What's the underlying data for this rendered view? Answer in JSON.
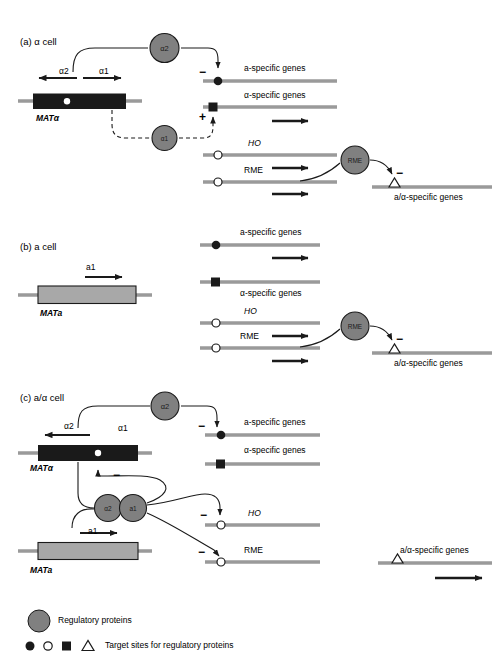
{
  "figure": {
    "type": "diagram",
    "colors": {
      "dna_line": "#9a9a9a",
      "protein_fill": "#808080",
      "mat_alpha_box": "#1a1a1a",
      "mat_a_box": "#a8a8a8",
      "stroke": "#1a1a1a"
    }
  },
  "panels": [
    {
      "id": "a",
      "title": "(a) α cell",
      "locus": {
        "name": "MATα",
        "style": "dark",
        "transcripts": [
          {
            "label": "α2",
            "direction": "left"
          },
          {
            "label": "α1",
            "direction": "right"
          }
        ]
      },
      "proteins": [
        {
          "label": "α2"
        },
        {
          "label": "α1"
        }
      ],
      "targets": [
        {
          "label": "a-specific genes",
          "italic": false,
          "site": "filled-circle",
          "sign": "−",
          "expressed": false
        },
        {
          "label": "α-specific genes",
          "italic": false,
          "site": "filled-square",
          "sign": "+",
          "expressed": true
        },
        {
          "label": "HO",
          "italic": true,
          "site": "open-circle",
          "sign": "",
          "expressed": true
        },
        {
          "label": "RME",
          "italic": false,
          "site": "open-circle",
          "sign": "",
          "expressed": true
        },
        {
          "label": "a/α-specific genes",
          "italic": false,
          "site": "open-triangle",
          "sign": "−",
          "expressed": false
        }
      ],
      "rme_protein": {
        "label": "RME"
      }
    },
    {
      "id": "b",
      "title": "(b) a cell",
      "locus": {
        "name": "MATa",
        "style": "light",
        "transcripts": [
          {
            "label": "a1",
            "direction": "right"
          }
        ]
      },
      "proteins": [],
      "targets": [
        {
          "label": "a-specific genes",
          "italic": false,
          "site": "filled-circle",
          "sign": "",
          "expressed": true
        },
        {
          "label": "α-specific genes",
          "italic": false,
          "site": "filled-square",
          "sign": "",
          "expressed": false
        },
        {
          "label": "HO",
          "italic": true,
          "site": "open-circle",
          "sign": "",
          "expressed": true
        },
        {
          "label": "RME",
          "italic": false,
          "site": "open-circle",
          "sign": "",
          "expressed": true
        },
        {
          "label": "a/α-specific genes",
          "italic": false,
          "site": "open-triangle",
          "sign": "−",
          "expressed": false
        }
      ],
      "rme_protein": {
        "label": "RME"
      }
    },
    {
      "id": "c",
      "title": "(c) a/α cell",
      "loci": [
        {
          "name": "MATα",
          "style": "dark",
          "transcripts": [
            {
              "label": "α2",
              "direction": "left"
            },
            {
              "label": "α1",
              "direction": "none"
            }
          ]
        },
        {
          "name": "MATa",
          "style": "light",
          "transcripts": [
            {
              "label": "a1",
              "direction": "right"
            }
          ]
        }
      ],
      "proteins": [
        {
          "label": "α2"
        },
        {
          "label": "α2"
        },
        {
          "label": "a1"
        }
      ],
      "targets": [
        {
          "label": "a-specific genes",
          "italic": false,
          "site": "filled-circle",
          "sign": "−",
          "expressed": false
        },
        {
          "label": "α-specific genes",
          "italic": false,
          "site": "filled-square",
          "sign": "",
          "expressed": false
        },
        {
          "label": "HO",
          "italic": true,
          "site": "open-circle",
          "sign": "−",
          "expressed": false
        },
        {
          "label": "RME",
          "italic": false,
          "site": "open-circle",
          "sign": "−",
          "expressed": false
        },
        {
          "label": "a/α-specific genes",
          "italic": false,
          "site": "open-triangle",
          "sign": "",
          "expressed": true
        }
      ],
      "repression_sign_on_a1": "−"
    }
  ],
  "legend": {
    "items": [
      {
        "symbol": "grey-circle",
        "label": "Regulatory proteins"
      },
      {
        "symbols": [
          "filled-circle",
          "open-circle",
          "filled-square",
          "open-triangle"
        ],
        "label": "Target sites for regulatory proteins"
      }
    ]
  }
}
